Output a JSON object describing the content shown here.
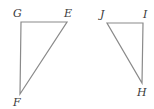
{
  "figure": {
    "width": 154,
    "height": 109,
    "stroke_color": "#8a8a8a",
    "label_color": "#3a3a3a",
    "triangles": [
      {
        "name": "triangle-GEF",
        "vertices": [
          {
            "label": "G",
            "x": 21,
            "y": 22,
            "label_x": 13,
            "label_y": 17
          },
          {
            "label": "E",
            "x": 67,
            "y": 22,
            "label_x": 64,
            "label_y": 17
          },
          {
            "label": "F",
            "x": 20,
            "y": 94,
            "label_x": 13,
            "label_y": 106
          }
        ]
      },
      {
        "name": "triangle-JIH",
        "vertices": [
          {
            "label": "J",
            "x": 107,
            "y": 23,
            "label_x": 100,
            "label_y": 18
          },
          {
            "label": "I",
            "x": 143,
            "y": 23,
            "label_x": 143,
            "label_y": 18
          },
          {
            "label": "H",
            "x": 142,
            "y": 83,
            "label_x": 137,
            "label_y": 96
          }
        ]
      }
    ]
  }
}
